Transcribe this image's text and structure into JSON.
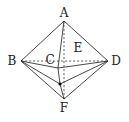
{
  "diagram": {
    "vertices": {
      "A": {
        "label": "A",
        "x": 64,
        "y": 21,
        "lx": 64,
        "ly": 17
      },
      "B": {
        "label": "B",
        "x": 21,
        "y": 61,
        "lx": 12,
        "ly": 65
      },
      "C": {
        "label": "C",
        "x": 58,
        "y": 68,
        "lx": 50,
        "ly": 64
      },
      "D": {
        "label": "D",
        "x": 108,
        "y": 61,
        "lx": 116,
        "ly": 65
      },
      "E": {
        "label": "E",
        "x": 72,
        "y": 54,
        "lx": 78,
        "ly": 52
      },
      "F": {
        "label": "F",
        "x": 64,
        "y": 99,
        "lx": 64,
        "ly": 112
      },
      "P": {
        "label": "",
        "x": 60,
        "y": 84
      }
    },
    "solid_edges": [
      [
        "A",
        "B"
      ],
      [
        "A",
        "D"
      ],
      [
        "A",
        "C"
      ],
      [
        "B",
        "C"
      ],
      [
        "C",
        "D"
      ],
      [
        "C",
        "P"
      ],
      [
        "B",
        "P"
      ],
      [
        "P",
        "D"
      ],
      [
        "B",
        "F"
      ],
      [
        "D",
        "F"
      ],
      [
        "P",
        "F"
      ]
    ],
    "dashed_edges": [
      [
        "B",
        "D"
      ],
      [
        "A",
        "F"
      ]
    ],
    "colors": {
      "line": "#333333",
      "label": "#222222",
      "point": "#000000"
    }
  }
}
